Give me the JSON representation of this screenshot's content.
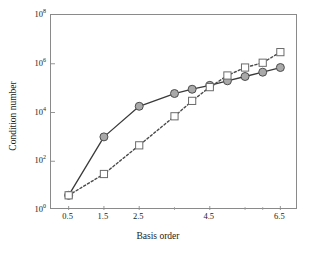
{
  "chart_data": {
    "type": "line",
    "title": "",
    "xlabel": "Basis order",
    "ylabel": "Condition number",
    "xlim": [
      0.0,
      7.0
    ],
    "ylim": [
      1,
      100000000
    ],
    "yscale": "log",
    "grid": false,
    "legend": null,
    "xticks": [
      0.5,
      1.5,
      2.5,
      4.5,
      6.5
    ],
    "xticklabels": [
      "0.5",
      "1.5",
      "2.5",
      "4.5",
      "6.5"
    ],
    "xminorticks": [
      3.5,
      5.5,
      6.0,
      7.0
    ],
    "yticks": [
      1,
      100,
      10000,
      1000000,
      100000000
    ],
    "yticklabels": [
      "10",
      "10",
      "10",
      "10",
      "10"
    ],
    "ytickexponents": [
      "0",
      "2",
      "4",
      "6",
      "8"
    ],
    "series": [
      {
        "name": "solid-circles",
        "linestyle": "solid",
        "marker": "circle-filled",
        "color": "#3a3a3a",
        "markerface": "#a9a9a9",
        "markeredge": "#4d4d4d",
        "x": [
          0.5,
          1.5,
          2.5,
          3.5,
          4.0,
          4.5,
          5.0,
          5.5,
          6.0,
          6.5
        ],
        "y": [
          4.0,
          1000.0,
          18000.0,
          60000.0,
          90000.0,
          130000.0,
          200000.0,
          300000.0,
          450000.0,
          700000.0
        ]
      },
      {
        "name": "dashed-squares",
        "linestyle": "dashed",
        "marker": "square-open",
        "color": "#4a4a4a",
        "markerface": "#ffffff",
        "markeredge": "#6b6b6b",
        "x": [
          0.5,
          1.5,
          2.5,
          3.5,
          4.0,
          4.5,
          5.0,
          5.5,
          6.0,
          6.5
        ],
        "y": [
          4.0,
          30.0,
          450.0,
          7000.0,
          30000.0,
          110000.0,
          330000.0,
          700000.0,
          1100000.0,
          3000000.0
        ]
      }
    ]
  },
  "axes": {
    "xlabel": "Basis order",
    "ylabel": "Condition number"
  },
  "ticks": {
    "y": [
      {
        "mantissa": "10",
        "exp": "0",
        "value": 1
      },
      {
        "mantissa": "10",
        "exp": "2",
        "value": 100
      },
      {
        "mantissa": "10",
        "exp": "4",
        "value": 10000
      },
      {
        "mantissa": "10",
        "exp": "6",
        "value": 1000000
      },
      {
        "mantissa": "10",
        "exp": "8",
        "value": 100000000
      }
    ],
    "x": [
      {
        "label": "0.5",
        "value": 0.5
      },
      {
        "label": "1.5",
        "value": 1.5
      },
      {
        "label": "2.5",
        "value": 2.5
      },
      {
        "label": "4.5",
        "value": 4.5
      },
      {
        "label": "6.5",
        "value": 6.5
      }
    ]
  },
  "colors": {
    "frame": "#8a8a8a",
    "solid_line": "#3a3a3a",
    "dashed_line": "#4a4a4a",
    "circle_fill": "#a9a9a9",
    "square_fill": "#ffffff",
    "text": "#1a1a1a",
    "background": "#ffffff"
  }
}
